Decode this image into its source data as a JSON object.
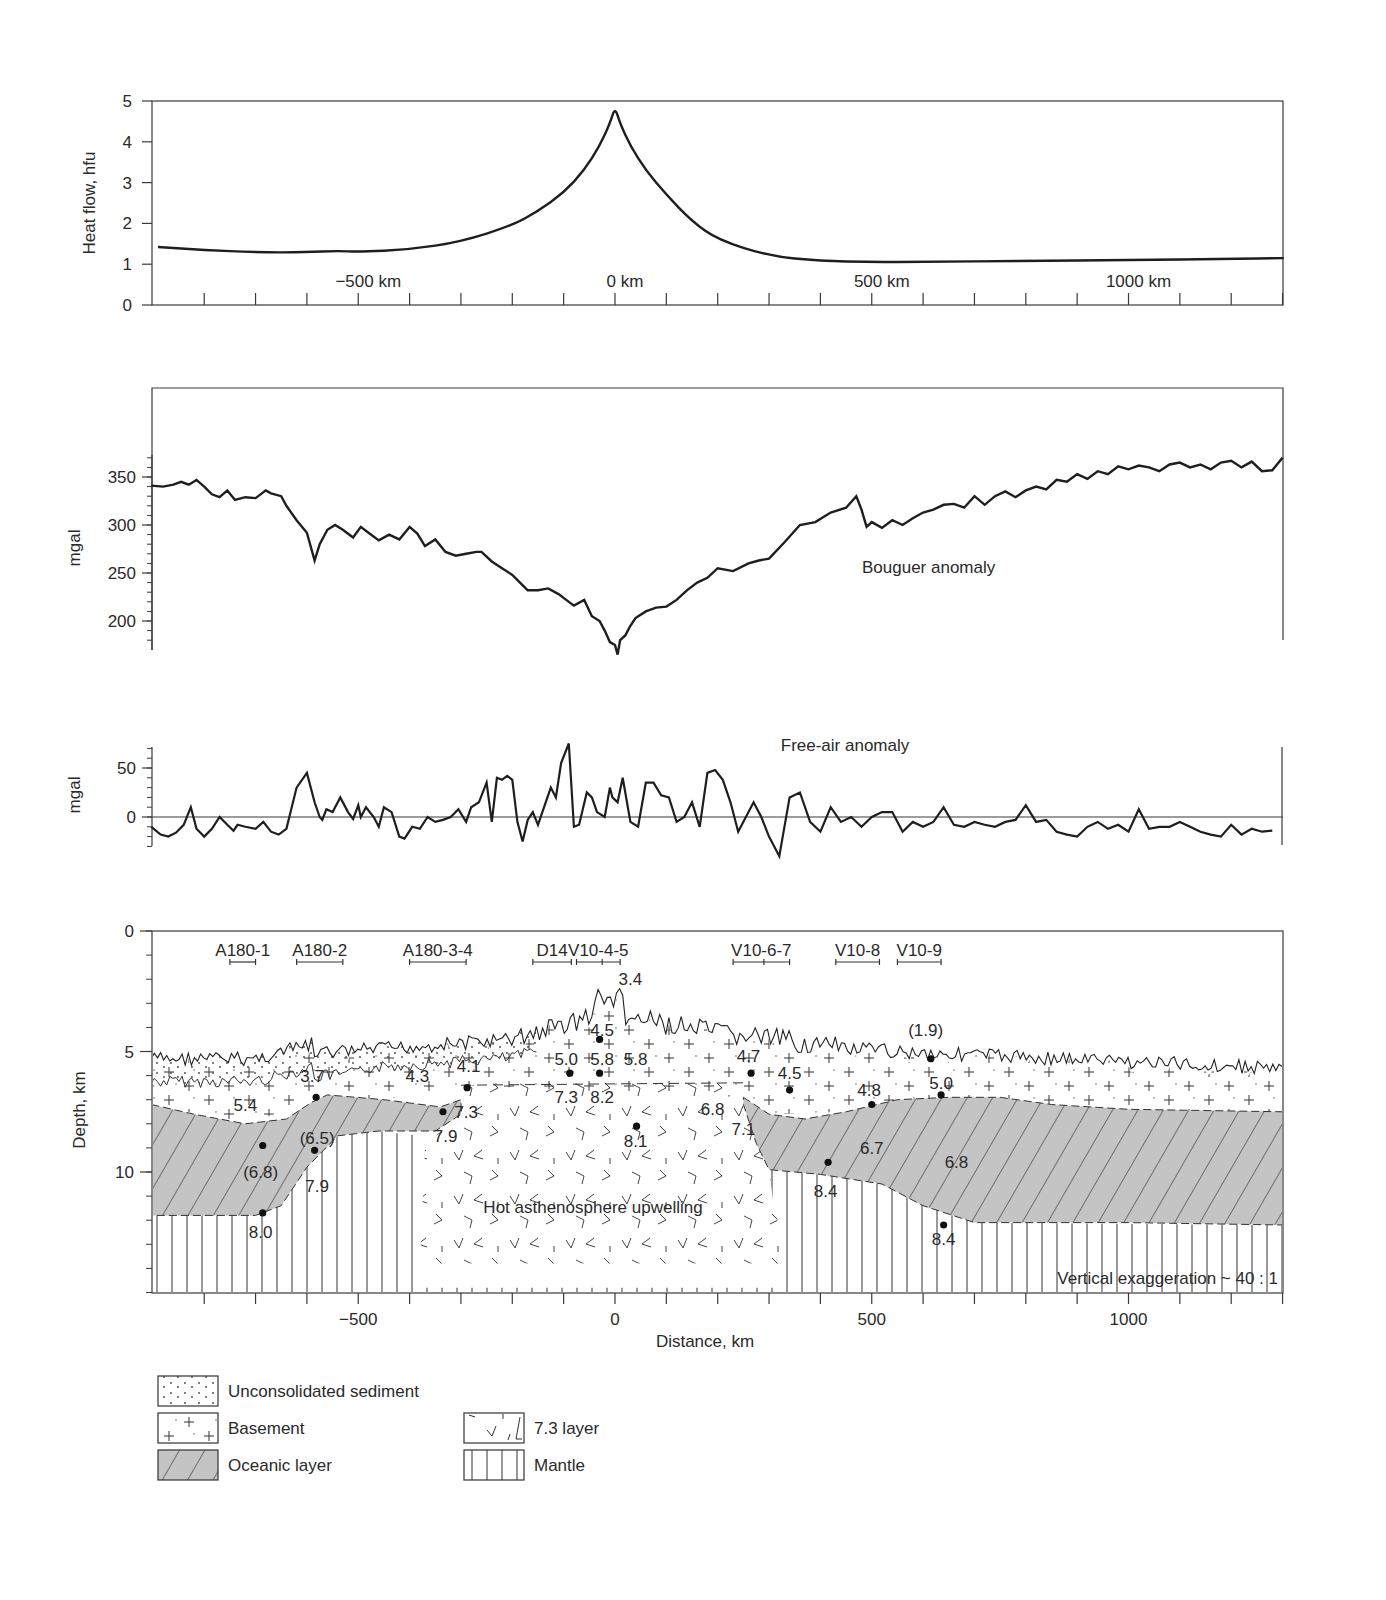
{
  "chart_data": [
    {
      "id": "heat_flow",
      "type": "line",
      "title": "",
      "ylabel": "Heat flow, hfu",
      "xlabel": "",
      "ylim": [
        0,
        5
      ],
      "yticks": [
        0,
        1,
        2,
        3,
        4,
        5
      ],
      "xlim": [
        -903,
        1302
      ],
      "xtick_labels": [
        {
          "x": -500,
          "label": "−500 km"
        },
        {
          "x": 0,
          "label": "0 km"
        },
        {
          "x": 500,
          "label": "500 km"
        },
        {
          "x": 1000,
          "label": "1000 km"
        }
      ],
      "x_minor_step": 100,
      "grid": false,
      "series": [
        {
          "name": "Heat flow",
          "x": [
            -890,
            -800,
            -700,
            -600,
            -540,
            -500,
            -400,
            -300,
            -200,
            -150,
            -100,
            -60,
            -30,
            -10,
            0,
            10,
            30,
            60,
            100,
            150,
            200,
            300,
            400,
            500,
            600,
            800,
            1000,
            1200,
            1302
          ],
          "y": [
            1.42,
            1.35,
            1.29,
            1.29,
            1.33,
            1.3,
            1.36,
            1.55,
            1.95,
            2.3,
            2.75,
            3.3,
            3.9,
            4.45,
            4.85,
            4.45,
            3.9,
            3.3,
            2.7,
            2.05,
            1.6,
            1.2,
            1.08,
            1.05,
            1.06,
            1.08,
            1.1,
            1.13,
            1.15
          ]
        }
      ]
    },
    {
      "id": "bouguer",
      "type": "line",
      "ylabel": "mgal",
      "ylim": [
        170,
        440
      ],
      "yticks": [
        200,
        250,
        300,
        350
      ],
      "yminor_step": 10,
      "annotation": "Bouguer anomaly",
      "series": [
        {
          "name": "Bouguer anomaly",
          "x": [
            -903,
            -880,
            -860,
            -845,
            -830,
            -815,
            -800,
            -785,
            -770,
            -755,
            -740,
            -720,
            -700,
            -680,
            -670,
            -650,
            -640,
            -620,
            -600,
            -585,
            -575,
            -560,
            -545,
            -530,
            -510,
            -495,
            -480,
            -460,
            -440,
            -420,
            -400,
            -385,
            -370,
            -350,
            -330,
            -310,
            -290,
            -270,
            -260,
            -240,
            -220,
            -200,
            -185,
            -170,
            -150,
            -130,
            -110,
            -95,
            -80,
            -60,
            -45,
            -30,
            -20,
            -10,
            0,
            5,
            10,
            20,
            30,
            40,
            60,
            80,
            100,
            120,
            140,
            160,
            180,
            200,
            230,
            260,
            280,
            300,
            330,
            360,
            390,
            420,
            450,
            470,
            480,
            490,
            500,
            520,
            540,
            560,
            580,
            600,
            620,
            640,
            660,
            680,
            700,
            720,
            740,
            760,
            780,
            800,
            820,
            840,
            860,
            880,
            900,
            920,
            940,
            960,
            980,
            1000,
            1020,
            1040,
            1060,
            1080,
            1100,
            1120,
            1140,
            1160,
            1180,
            1200,
            1220,
            1240,
            1260,
            1280,
            1300
          ],
          "y": [
            341,
            340,
            342,
            345,
            342,
            347,
            340,
            332,
            329,
            336,
            326,
            329,
            328,
            336,
            333,
            330,
            320,
            305,
            292,
            263,
            280,
            295,
            300,
            295,
            287,
            298,
            292,
            284,
            290,
            285,
            298,
            291,
            278,
            285,
            272,
            268,
            270,
            272,
            272,
            262,
            255,
            248,
            240,
            232,
            232,
            234,
            228,
            222,
            216,
            222,
            205,
            200,
            190,
            178,
            175,
            165,
            180,
            185,
            195,
            203,
            210,
            214,
            215,
            222,
            232,
            240,
            245,
            255,
            252,
            260,
            263,
            265,
            282,
            300,
            303,
            313,
            318,
            330,
            316,
            298,
            303,
            297,
            305,
            300,
            307,
            313,
            316,
            321,
            322,
            318,
            330,
            321,
            330,
            335,
            329,
            336,
            340,
            337,
            347,
            345,
            353,
            348,
            356,
            353,
            361,
            358,
            362,
            360,
            356,
            363,
            365,
            360,
            363,
            358,
            365,
            367,
            360,
            366,
            356,
            357,
            370
          ]
        }
      ]
    },
    {
      "id": "free_air",
      "type": "line",
      "ylabel": "mgal",
      "ylim": [
        -35,
        75
      ],
      "yticks": [
        0,
        50
      ],
      "yminor_step": 10,
      "annotation": "Free-air anomaly",
      "series": [
        {
          "name": "Free-air anomaly",
          "x": [
            -903,
            -885,
            -870,
            -855,
            -840,
            -826,
            -815,
            -800,
            -785,
            -770,
            -755,
            -743,
            -735,
            -720,
            -700,
            -685,
            -670,
            -655,
            -640,
            -620,
            -600,
            -585,
            -575,
            -570,
            -562,
            -550,
            -535,
            -520,
            -510,
            -500,
            -495,
            -485,
            -470,
            -460,
            -450,
            -435,
            -420,
            -410,
            -395,
            -380,
            -365,
            -350,
            -335,
            -320,
            -305,
            -290,
            -280,
            -265,
            -250,
            -240,
            -230,
            -220,
            -210,
            -200,
            -190,
            -180,
            -170,
            -160,
            -150,
            -135,
            -125,
            -115,
            -105,
            -90,
            -80,
            -70,
            -55,
            -45,
            -35,
            -20,
            -10,
            -5,
            5,
            15,
            30,
            45,
            60,
            75,
            90,
            105,
            120,
            135,
            150,
            165,
            180,
            195,
            210,
            225,
            240,
            255,
            270,
            285,
            300,
            320,
            340,
            360,
            380,
            400,
            420,
            440,
            460,
            480,
            500,
            520,
            540,
            560,
            580,
            600,
            620,
            640,
            660,
            680,
            700,
            720,
            740,
            760,
            780,
            800,
            820,
            840,
            860,
            880,
            900,
            920,
            940,
            960,
            980,
            1000,
            1020,
            1040,
            1060,
            1080,
            1100,
            1120,
            1140,
            1160,
            1180,
            1200,
            1220,
            1240,
            1260,
            1280
          ],
          "y": [
            -10,
            -18,
            -20,
            -16,
            -8,
            10,
            -12,
            -20,
            -12,
            0,
            -8,
            -14,
            -8,
            -10,
            -12,
            -5,
            -15,
            -18,
            -12,
            30,
            45,
            15,
            0,
            -3,
            8,
            5,
            20,
            5,
            -2,
            12,
            0,
            10,
            0,
            -10,
            10,
            5,
            -20,
            -22,
            -10,
            -12,
            0,
            -5,
            -3,
            0,
            8,
            -5,
            10,
            15,
            35,
            -5,
            40,
            38,
            42,
            38,
            -5,
            -25,
            -3,
            5,
            -8,
            15,
            30,
            20,
            55,
            75,
            -10,
            -8,
            25,
            20,
            5,
            0,
            30,
            20,
            15,
            40,
            -5,
            -10,
            35,
            35,
            22,
            20,
            -5,
            0,
            15,
            -10,
            45,
            48,
            38,
            15,
            -15,
            0,
            15,
            0,
            -20,
            -40,
            20,
            25,
            -5,
            -15,
            10,
            -5,
            0,
            -10,
            0,
            5,
            5,
            -15,
            -5,
            -10,
            -5,
            10,
            -8,
            -10,
            -5,
            -8,
            -10,
            -5,
            -3,
            12,
            -5,
            -3,
            -15,
            -18,
            -20,
            -10,
            -5,
            -12,
            -8,
            -15,
            8,
            -12,
            -10,
            -10,
            -5,
            -10,
            -15,
            -18,
            -20,
            -8,
            -18,
            -12,
            -15,
            -14
          ]
        }
      ]
    },
    {
      "id": "cross_section",
      "type": "area",
      "title": "",
      "xlabel": "Distance, km",
      "ylabel": "Depth, km",
      "xlim": [
        -903,
        1302
      ],
      "ylim": [
        0,
        15
      ],
      "yaxis_inverted": true,
      "yticks": [
        0,
        5,
        10
      ],
      "yminor_step": 1,
      "xticks": [
        -500,
        0,
        500,
        1000
      ],
      "x_minor_step": 100,
      "annotations": [
        {
          "text": "Hot asthenosphere upwelling",
          "x": 25,
          "y": 11.4
        },
        {
          "text": "Vertical exaggeration ~ 40 : 1",
          "x": 1000,
          "y": 14.4
        }
      ],
      "profiles": [
        {
          "name": "A180-1",
          "x0": -750,
          "x1": -700
        },
        {
          "name": "A180-2",
          "x0": -620,
          "x1": -530
        },
        {
          "name": "A180-3-4",
          "x0": -400,
          "x1": -290
        },
        {
          "name": "D14",
          "x0": -160,
          "x1": -85
        },
        {
          "name": "V10-4-5",
          "x0": -75,
          "x1": 10,
          "mid": -25
        },
        {
          "name": "V10-6-7",
          "x0": 230,
          "x1": 340,
          "mid": 290
        },
        {
          "name": "V10-8",
          "x0": 430,
          "x1": 515
        },
        {
          "name": "V10-9",
          "x0": 550,
          "x1": 635
        }
      ],
      "velocity_labels": [
        {
          "v": "3.4",
          "x": 30,
          "y": 2.0
        },
        {
          "v": "4.5",
          "x": -25,
          "y": 4.1
        },
        {
          "v": "5.0",
          "x": -95,
          "y": 5.3
        },
        {
          "v": "5.8",
          "x": -25,
          "y": 5.3
        },
        {
          "v": "5.8",
          "x": 40,
          "y": 5.3
        },
        {
          "v": "7.3",
          "x": -95,
          "y": 6.9
        },
        {
          "v": "8.2",
          "x": -25,
          "y": 6.9
        },
        {
          "v": "6.8",
          "x": 190,
          "y": 7.4
        },
        {
          "v": "8.1",
          "x": 40,
          "y": 8.7
        },
        {
          "v": "7.1",
          "x": 250,
          "y": 8.2
        },
        {
          "v": "4.7",
          "x": 260,
          "y": 5.2
        },
        {
          "v": "4.5",
          "x": 340,
          "y": 5.9
        },
        {
          "v": "4.8",
          "x": 495,
          "y": 6.6
        },
        {
          "v": "5.0",
          "x": 635,
          "y": 6.3
        },
        {
          "v": "(1.9)",
          "x": 605,
          "y": 4.1
        },
        {
          "v": "6.7",
          "x": 500,
          "y": 9.0
        },
        {
          "v": "6.8",
          "x": 665,
          "y": 9.6
        },
        {
          "v": "8.4",
          "x": 410,
          "y": 10.8
        },
        {
          "v": "8.4",
          "x": 640,
          "y": 12.8
        },
        {
          "v": "3.7",
          "x": -590,
          "y": 6.0
        },
        {
          "v": "4.3",
          "x": -385,
          "y": 6.0
        },
        {
          "v": "4.1",
          "x": -285,
          "y": 5.6
        },
        {
          "v": "5.4",
          "x": -720,
          "y": 7.2
        },
        {
          "v": "7.3",
          "x": -290,
          "y": 7.5
        },
        {
          "v": "7.9",
          "x": -330,
          "y": 8.5
        },
        {
          "v": "(6.5)",
          "x": -580,
          "y": 8.6
        },
        {
          "v": "(6.8)",
          "x": -690,
          "y": 10.0
        },
        {
          "v": "7.9",
          "x": -580,
          "y": 10.6
        },
        {
          "v": "8.0",
          "x": -690,
          "y": 12.5
        }
      ],
      "stations": [
        {
          "x": -686,
          "y": 8.9
        },
        {
          "x": -582,
          "y": 6.9
        },
        {
          "x": -585,
          "y": 9.1
        },
        {
          "x": -686,
          "y": 11.7
        },
        {
          "x": -335,
          "y": 7.5
        },
        {
          "x": -288,
          "y": 6.5
        },
        {
          "x": -88,
          "y": 5.9
        },
        {
          "x": -30,
          "y": 5.9
        },
        {
          "x": -30,
          "y": 4.5
        },
        {
          "x": 42,
          "y": 8.1
        },
        {
          "x": 265,
          "y": 5.9
        },
        {
          "x": 340,
          "y": 6.6
        },
        {
          "x": 500,
          "y": 7.2
        },
        {
          "x": 615,
          "y": 5.3
        },
        {
          "x": 635,
          "y": 6.8
        },
        {
          "x": 415,
          "y": 9.6
        },
        {
          "x": 640,
          "y": 12.2
        }
      ]
    }
  ],
  "legend": {
    "items": [
      {
        "key": "sediment",
        "label": "Unconsolidated sediment"
      },
      {
        "key": "basement",
        "label": "Basement"
      },
      {
        "key": "oceanic",
        "label": "Oceanic layer"
      },
      {
        "key": "layer73",
        "label": "7.3 layer"
      },
      {
        "key": "mantle",
        "label": "Mantle"
      }
    ]
  },
  "colors": {
    "line": "#1e1e1e",
    "axis": "#3a3a3a",
    "oceanic_fill": "#c4c4c4",
    "text": "#2a2a2a"
  }
}
